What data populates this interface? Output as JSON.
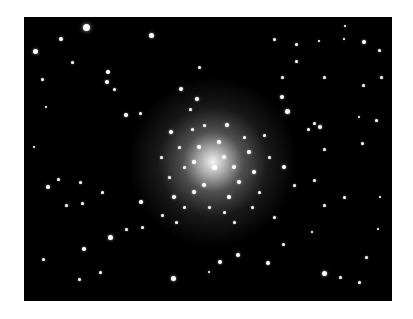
{
  "image": {
    "subject": "globular star cluster",
    "background_color": "#000000",
    "page_background": "#ffffff",
    "cluster_center": [
      189,
      145
    ],
    "stars": [
      [
        62,
        10,
        3.5
      ],
      [
        37,
        22,
        2
      ],
      [
        11,
        34,
        2.5
      ],
      [
        127,
        18,
        2.5
      ],
      [
        48,
        45,
        1.5
      ],
      [
        84,
        55,
        1.8
      ],
      [
        175,
        50,
        1.5
      ],
      [
        250,
        22,
        1.5
      ],
      [
        272,
        27,
        1.5
      ],
      [
        295,
        24,
        1.2
      ],
      [
        320,
        22,
        1.2
      ],
      [
        321,
        9,
        1.2
      ],
      [
        340,
        25,
        2
      ],
      [
        355,
        33,
        1.5
      ],
      [
        357,
        60,
        1.5
      ],
      [
        272,
        44,
        1.5
      ],
      [
        258,
        60,
        1.5
      ],
      [
        300,
        60,
        1.5
      ],
      [
        339,
        68,
        1.5
      ],
      [
        18,
        62,
        1.5
      ],
      [
        22,
        90,
        1.2
      ],
      [
        83,
        65,
        2
      ],
      [
        90,
        72,
        1.5
      ],
      [
        102,
        98,
        1.8
      ],
      [
        116,
        96,
        1.5
      ],
      [
        157,
        72,
        2
      ],
      [
        173,
        82,
        2
      ],
      [
        166,
        92,
        1.5
      ],
      [
        203,
        108,
        2
      ],
      [
        258,
        80,
        2.2
      ],
      [
        263,
        94,
        2.5
      ],
      [
        284,
        112,
        1.5
      ],
      [
        290,
        106,
        1.5
      ],
      [
        296,
        110,
        2
      ],
      [
        300,
        132,
        1.5
      ],
      [
        335,
        100,
        1.2
      ],
      [
        352,
        103,
        1.5
      ],
      [
        338,
        126,
        1.5
      ],
      [
        10,
        130,
        1.2
      ],
      [
        24,
        170,
        2
      ],
      [
        34,
        162,
        1.5
      ],
      [
        56,
        165,
        1.5
      ],
      [
        42,
        188,
        1.5
      ],
      [
        58,
        186,
        1.5
      ],
      [
        78,
        175,
        1.5
      ],
      [
        117,
        185,
        1.8
      ],
      [
        118,
        210,
        1.5
      ],
      [
        102,
        212,
        1.5
      ],
      [
        86,
        220,
        2.5
      ],
      [
        60,
        232,
        1.8
      ],
      [
        76,
        255,
        1.5
      ],
      [
        55,
        262,
        1.5
      ],
      [
        19,
        242,
        1.5
      ],
      [
        149,
        261,
        2.5
      ],
      [
        185,
        255,
        1.2
      ],
      [
        196,
        245,
        2
      ],
      [
        214,
        238,
        2
      ],
      [
        244,
        246,
        2
      ],
      [
        259,
        227,
        1.5
      ],
      [
        288,
        215,
        1.2
      ],
      [
        300,
        256,
        2.5
      ],
      [
        316,
        260,
        1.5
      ],
      [
        335,
        265,
        1.5
      ],
      [
        342,
        240,
        1.5
      ],
      [
        354,
        212,
        1.2
      ],
      [
        356,
        180,
        1.2
      ],
      [
        320,
        180,
        1.5
      ],
      [
        300,
        188,
        1.5
      ],
      [
        290,
        163,
        1.5
      ],
      [
        270,
        168,
        1.5
      ],
      [
        260,
        150,
        2
      ],
      [
        147,
        115,
        2
      ],
      [
        137,
        140,
        1.5
      ],
      [
        145,
        160,
        1.5
      ],
      [
        150,
        180,
        2
      ],
      [
        160,
        190,
        1.5
      ],
      [
        170,
        175,
        2
      ],
      [
        180,
        168,
        2
      ],
      [
        190,
        150,
        2.5
      ],
      [
        200,
        140,
        2.2
      ],
      [
        210,
        150,
        2
      ],
      [
        215,
        165,
        2
      ],
      [
        205,
        180,
        1.8
      ],
      [
        225,
        135,
        1.8
      ],
      [
        230,
        155,
        2
      ],
      [
        235,
        175,
        1.5
      ],
      [
        220,
        120,
        1.5
      ],
      [
        195,
        125,
        2
      ],
      [
        175,
        130,
        2
      ],
      [
        170,
        145,
        1.8
      ],
      [
        160,
        150,
        1.5
      ],
      [
        185,
        190,
        1.5
      ],
      [
        200,
        195,
        1.5
      ],
      [
        245,
        140,
        1.5
      ],
      [
        240,
        118,
        1.5
      ],
      [
        168,
        112,
        1.5
      ],
      [
        180,
        108,
        1.5
      ],
      [
        155,
        130,
        1.5
      ],
      [
        210,
        205,
        1.5
      ],
      [
        228,
        190,
        1.5
      ],
      [
        250,
        200,
        1.5
      ],
      [
        152,
        205,
        1.5
      ],
      [
        138,
        198,
        1.5
      ]
    ]
  }
}
